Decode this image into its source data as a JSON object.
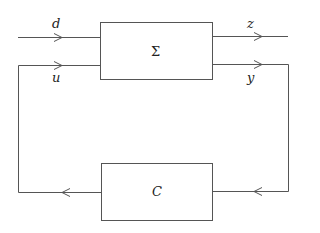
{
  "diagram": {
    "type": "feedback-loop block diagram",
    "blocks": [
      {
        "id": "plant",
        "label": "Σ"
      },
      {
        "id": "controller",
        "label": "C"
      }
    ],
    "signals": {
      "d": "d",
      "u": "u",
      "z": "z",
      "y": "y"
    },
    "colors": {
      "line": "#555555",
      "text": "#222222",
      "background": "#ffffff"
    }
  }
}
